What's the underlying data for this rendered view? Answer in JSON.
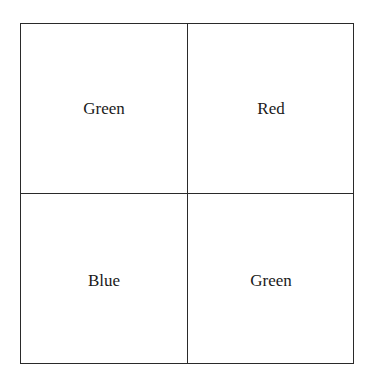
{
  "grid": {
    "rows": 2,
    "cols": 2,
    "cells": [
      {
        "row": 0,
        "col": 0,
        "label": "Green"
      },
      {
        "row": 0,
        "col": 1,
        "label": "Red"
      },
      {
        "row": 1,
        "col": 0,
        "label": "Blue"
      },
      {
        "row": 1,
        "col": 1,
        "label": "Green"
      }
    ],
    "line_color": "#2a2a2a",
    "text_color": "#1a1a1a"
  }
}
